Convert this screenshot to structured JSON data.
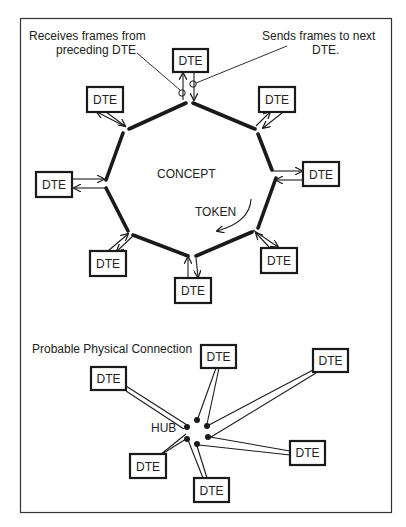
{
  "annotations": {
    "receives_line1": "Receives frames from",
    "receives_line2": "preceding DTE",
    "sends_line1": "Sends frames to next",
    "sends_line2": "DTE."
  },
  "ring": {
    "center_label": "CONCEPT",
    "direction_label": "TOKEN",
    "node_label": "DTE",
    "node_count": 8
  },
  "physical": {
    "title": "Probable Physical Connection",
    "hub_label": "HUB",
    "node_label": "DTE",
    "node_count": 6
  },
  "colors": {
    "ink": "#1a1a1a",
    "background": "#ffffff",
    "frame": "#333333"
  }
}
